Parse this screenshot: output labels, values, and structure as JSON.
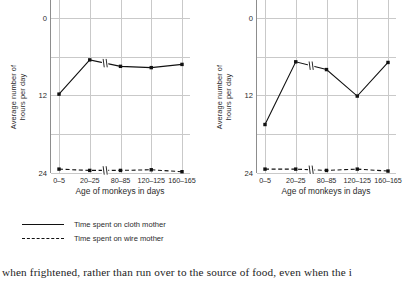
{
  "charts": [
    {
      "id": "left",
      "ylabel": "Average number of\nhours per day",
      "xlabel": "Age of monkeys in days",
      "yticks": [
        "24",
        "12",
        "0"
      ],
      "xticks": [
        "0–5",
        "20–25",
        "80–85",
        "120–125",
        "160–165"
      ]
    },
    {
      "id": "right",
      "ylabel": "Average number of\nhours per day",
      "xlabel": "Age of monkeys in days",
      "yticks": [
        "24",
        "12",
        "0"
      ],
      "xticks": [
        "0–5",
        "20–25",
        "80–85",
        "120–125",
        "160–165"
      ]
    }
  ],
  "legend": {
    "items": [
      {
        "label": "Time spent on cloth mother",
        "style": "solid"
      },
      {
        "label": "Time spent on wire mother",
        "style": "dashed"
      }
    ]
  },
  "caption": "when frightened, rather than run over to the source of food, even when the i",
  "colors": {
    "line": "#111111",
    "grid": "#c9c9c9",
    "axis": "#8d8d8d",
    "text": "#2b2b2b"
  },
  "chart_data": [
    {
      "type": "line",
      "title": "",
      "xlabel": "Age of monkeys in days",
      "ylabel": "Average number of hours per day",
      "categories": [
        "0–5",
        "20–25",
        "80–85",
        "120–125",
        "160–165"
      ],
      "ylim": [
        0,
        28
      ],
      "yticks": [
        0,
        12,
        24
      ],
      "grid": true,
      "legend_position": "below-figure",
      "axis_break": true,
      "series": [
        {
          "name": "Time spent on cloth mother",
          "style": "solid",
          "values": [
            12.2,
            17.5,
            16.5,
            16.3,
            16.8
          ]
        },
        {
          "name": "Time spent on wire mother",
          "style": "dashed",
          "values": [
            0.6,
            0.4,
            0.4,
            0.5,
            0.2
          ]
        }
      ]
    },
    {
      "type": "line",
      "title": "",
      "xlabel": "Age of monkeys in days",
      "ylabel": "Average number of hours per day",
      "categories": [
        "0–5",
        "20–25",
        "80–85",
        "120–125",
        "160–165"
      ],
      "ylim": [
        0,
        28
      ],
      "yticks": [
        0,
        12,
        24
      ],
      "grid": true,
      "legend_position": "below-figure",
      "axis_break": true,
      "series": [
        {
          "name": "Time spent on cloth mother",
          "style": "solid",
          "values": [
            7.5,
            17.2,
            16.0,
            11.9,
            17.1
          ]
        },
        {
          "name": "Time spent on wire mother",
          "style": "dashed",
          "values": [
            0.6,
            0.6,
            0.4,
            0.6,
            0.3
          ]
        }
      ]
    }
  ]
}
